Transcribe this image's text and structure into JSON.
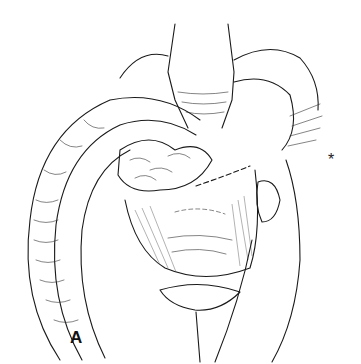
{
  "figure": {
    "panel_label": "A",
    "marker": "*",
    "colors": {
      "ink": "#1a1a1a",
      "background": "#ffffff"
    }
  }
}
